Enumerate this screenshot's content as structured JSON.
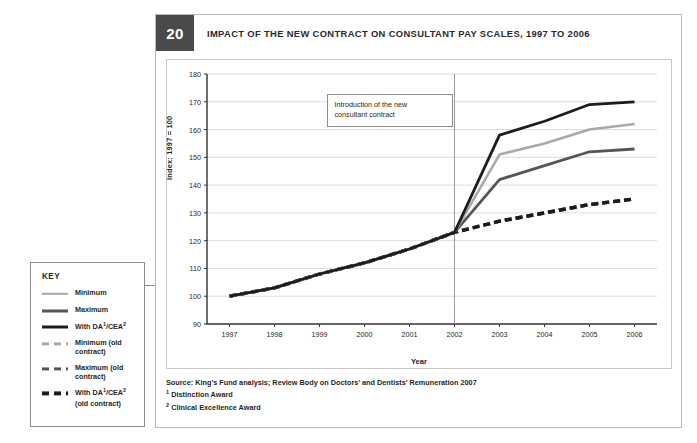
{
  "figure": {
    "number": "20",
    "title": "IMPACT OF THE NEW CONTRACT ON CONSULTANT PAY SCALES, 1997 TO 2006"
  },
  "annotation": {
    "line1": "Introduction of the new",
    "line2": "consultant contract",
    "at_year": "2002"
  },
  "source": {
    "main": "Source: King’s Fund analysis; Review Body on Doctors’ and Dentists’ Remuneration 2007",
    "footnote1_marker": "1",
    "footnote1": "Distinction Award",
    "footnote2_marker": "2",
    "footnote2": "Clinical Excellence Award"
  },
  "key": {
    "title": "KEY",
    "items": [
      {
        "label": "Minimum",
        "style": "solid",
        "color": "#a9a9a9"
      },
      {
        "label": "Maximum",
        "style": "solid",
        "color": "#555555"
      },
      {
        "label": "With DA¹/CEA²",
        "style": "solid",
        "color": "#1c1c1c"
      },
      {
        "label": "Minimum (old contract)",
        "style": "dashed",
        "color": "#a9a9a9"
      },
      {
        "label": "Maximum (old contract)",
        "style": "dashed",
        "color": "#555555"
      },
      {
        "label": "With DA¹/CEA² (old contract)",
        "style": "dashed",
        "color": "#1c1c1c"
      }
    ]
  },
  "chart_data": {
    "type": "line",
    "title": "IMPACT OF THE NEW CONTRACT ON CONSULTANT PAY SCALES, 1997 TO 2006",
    "xlabel": "Year",
    "ylabel": "Index: 1997 = 100",
    "categories": [
      "1997",
      "1998",
      "1999",
      "2000",
      "2001",
      "2002",
      "2003",
      "2004",
      "2005",
      "2006"
    ],
    "x": [
      1997,
      1998,
      1999,
      2000,
      2001,
      2002,
      2003,
      2004,
      2005,
      2006
    ],
    "ylim": [
      90,
      180
    ],
    "yticks": [
      90,
      100,
      110,
      120,
      130,
      140,
      150,
      160,
      170,
      180
    ],
    "grid": true,
    "legend_position": "outside-left",
    "series": [
      {
        "name": "Minimum",
        "style": "solid",
        "color": "#a9a9a9",
        "values": [
          100,
          103,
          108,
          112,
          117,
          123,
          151,
          155,
          160,
          162
        ]
      },
      {
        "name": "Maximum",
        "style": "solid",
        "color": "#555555",
        "values": [
          100,
          103,
          108,
          112,
          117,
          123,
          142,
          147,
          152,
          153
        ]
      },
      {
        "name": "With DA¹/CEA²",
        "style": "solid",
        "color": "#1c1c1c",
        "values": [
          100,
          103,
          108,
          112,
          117,
          123,
          158,
          163,
          169,
          170
        ]
      },
      {
        "name": "Minimum (old contract)",
        "style": "dashed",
        "color": "#a9a9a9",
        "values": [
          100,
          103,
          108,
          112,
          117,
          123,
          127,
          130,
          133,
          135
        ]
      },
      {
        "name": "Maximum (old contract)",
        "style": "dashed",
        "color": "#555555",
        "values": [
          100,
          103,
          108,
          112,
          117,
          123,
          127,
          130,
          133,
          135
        ]
      },
      {
        "name": "With DA¹/CEA² (old contract)",
        "style": "dashed",
        "color": "#1c1c1c",
        "values": [
          100,
          103,
          108,
          112,
          117,
          123,
          127,
          130,
          133,
          135
        ]
      }
    ],
    "annotations": [
      {
        "text": "Introduction of the new consultant contract",
        "x": 2002
      }
    ]
  }
}
